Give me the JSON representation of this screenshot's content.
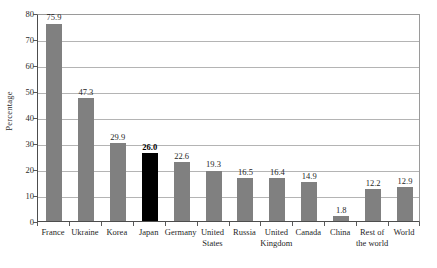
{
  "chart_data": {
    "type": "bar",
    "title": "",
    "xlabel": "",
    "ylabel": "Percentage",
    "ylim": [
      0,
      80
    ],
    "ytick_step": 10,
    "yticks": [
      "0",
      "10",
      "20",
      "30",
      "40",
      "50",
      "60",
      "70",
      "80"
    ],
    "grid": true,
    "legend": "none",
    "categories": [
      "France",
      "Ukraine",
      "Korea",
      "Japan",
      "Germany",
      "United States",
      "Russia",
      "United Kingdom",
      "Canada",
      "China",
      "Rest of the world",
      "World"
    ],
    "category_lines": [
      [
        "France",
        ""
      ],
      [
        "Ukraine",
        ""
      ],
      [
        "Korea",
        ""
      ],
      [
        "Japan",
        ""
      ],
      [
        "Germany",
        ""
      ],
      [
        "United",
        "States"
      ],
      [
        "Russia",
        ""
      ],
      [
        "United",
        "Kingdom"
      ],
      [
        "Canada",
        ""
      ],
      [
        "China",
        ""
      ],
      [
        "Rest of",
        "the world"
      ],
      [
        "World",
        ""
      ]
    ],
    "values": [
      75.9,
      47.3,
      29.9,
      26.0,
      22.6,
      19.3,
      16.5,
      16.4,
      14.9,
      1.8,
      12.2,
      12.9
    ],
    "value_labels": [
      "75.9",
      "47.3",
      "29.9",
      "26.0",
      "22.6",
      "19.3",
      "16.5",
      "16.4",
      "14.9",
      "1.8",
      "12.2",
      "12.9"
    ],
    "highlight_index": 3,
    "colors": {
      "bar": "#808080",
      "bar_highlight": "#000000",
      "gridline": "#b4b4b4",
      "axis": "#4d4d4d",
      "background": "#ffffff",
      "text": "#1f1f1f"
    }
  }
}
